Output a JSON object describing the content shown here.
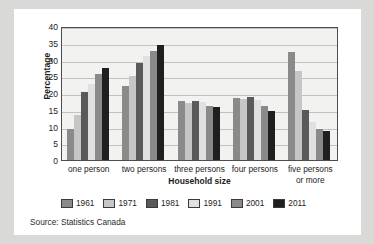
{
  "chart_data": {
    "type": "bar",
    "title": "",
    "xlabel": "Household size",
    "ylabel": "Percentage",
    "ylim": [
      0,
      40
    ],
    "yticks": [
      0,
      5,
      10,
      15,
      20,
      25,
      30,
      35,
      40
    ],
    "grid": true,
    "legend_position": "bottom",
    "categories": [
      "one person",
      "two persons",
      "three persons",
      "four persons",
      "five persons or more"
    ],
    "category_lines": [
      [
        "one person"
      ],
      [
        "two persons"
      ],
      [
        "three persons"
      ],
      [
        "four persons"
      ],
      [
        "five persons",
        "or more"
      ]
    ],
    "series": [
      {
        "name": "1961",
        "color": "#8a8a8a",
        "values": [
          9.3,
          22.0,
          17.6,
          18.4,
          32.3
        ]
      },
      {
        "name": "1971",
        "color": "#c6c6c6",
        "values": [
          13.4,
          25.0,
          17.0,
          18.2,
          26.6
        ]
      },
      {
        "name": "1981",
        "color": "#5a5a5a",
        "values": [
          20.3,
          28.9,
          17.5,
          18.9,
          15.0
        ]
      },
      {
        "name": "1991",
        "color": "#e0e0e0",
        "values": [
          22.6,
          31.1,
          17.4,
          17.8,
          11.2
        ]
      },
      {
        "name": "2001",
        "color": "#8a8a8a",
        "values": [
          25.7,
          32.6,
          16.0,
          16.2,
          9.4
        ]
      },
      {
        "name": "2011",
        "color": "#1f1f1f",
        "values": [
          27.6,
          34.2,
          15.7,
          14.6,
          8.7
        ]
      }
    ],
    "annotations": {
      "source": "Source: Statistics Canada"
    }
  },
  "colors": {
    "page_background": "#d9d9d7",
    "card_background": "#ffffff",
    "plot_background": "#f2f2f0",
    "axis": "#4d4d4d",
    "gridline": "#c2c2c0",
    "text": "#1c1c1c"
  }
}
